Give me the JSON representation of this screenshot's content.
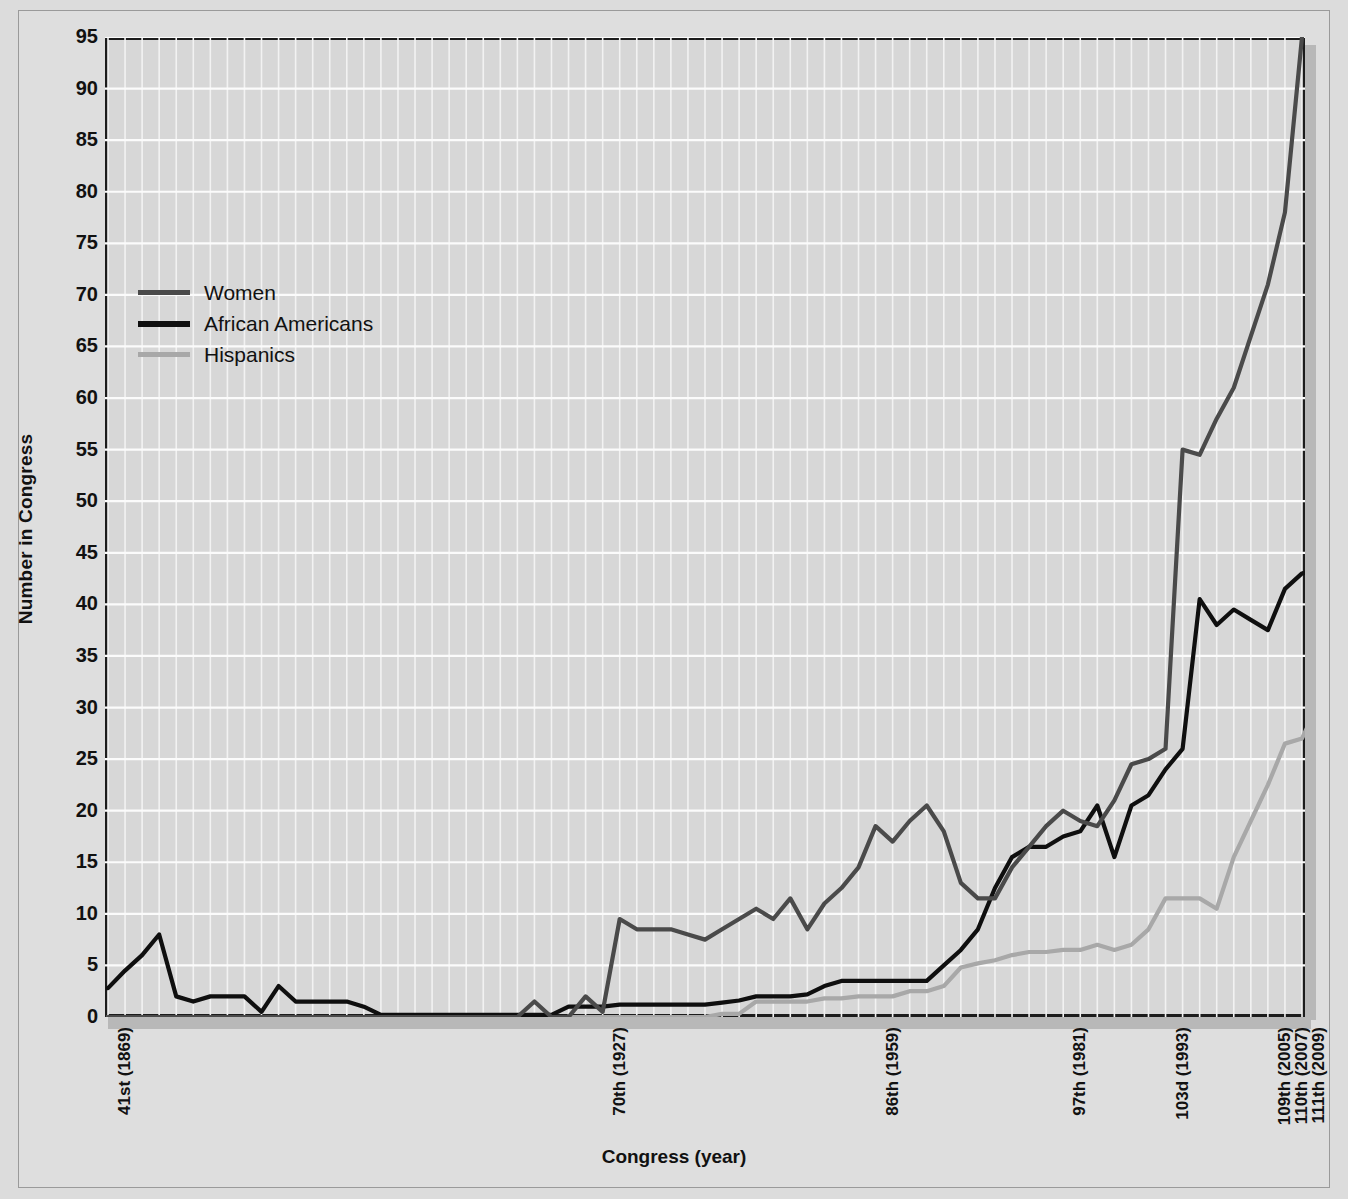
{
  "chart_data": {
    "type": "line",
    "title": "",
    "xlabel": "Congress (year)",
    "ylabel": "Number in Congress",
    "ylim": [
      0,
      95
    ],
    "ytick_step": 5,
    "yticks": [
      95,
      90,
      85,
      80,
      75,
      70,
      65,
      60,
      55,
      50,
      45,
      40,
      35,
      30,
      25,
      20,
      15,
      10,
      5,
      0
    ],
    "grid": true,
    "legend_position": "upper-left",
    "x_tick_labels": [
      {
        "label": "41st (1869)",
        "index": 0
      },
      {
        "label": "70th (1927)",
        "index": 29
      },
      {
        "label": "86th (1959)",
        "index": 45
      },
      {
        "label": "97th (1981)",
        "index": 56
      },
      {
        "label": "103d (1993)",
        "index": 62
      },
      {
        "label": "109th (2005)",
        "index": 68
      },
      {
        "label": "110th (2007)",
        "index": 69
      },
      {
        "label": "111th (2009)",
        "index": 70
      }
    ],
    "x_count": 71,
    "series": [
      {
        "name": "Women",
        "color": "#4a4a4a",
        "values": [
          0,
          0,
          0,
          0,
          0,
          0,
          0,
          0,
          0,
          0,
          0,
          0,
          0,
          0,
          0,
          0,
          0,
          0,
          0,
          0,
          0,
          0,
          0,
          0,
          0,
          1.5,
          0,
          0,
          2,
          0.5,
          9.5,
          8.5,
          8.5,
          8.5,
          8,
          7.5,
          8.5,
          9.5,
          10.5,
          9.5,
          11.5,
          8.5,
          11,
          12.5,
          14.5,
          18.5,
          17,
          19,
          20.5,
          18,
          13,
          11.5,
          11.5,
          14.5,
          16.5,
          18.5,
          20,
          19,
          18.5,
          21,
          24.5,
          25,
          26,
          55,
          54.5,
          58,
          61,
          66,
          71,
          78,
          95
        ]
      },
      {
        "name": "African Americans",
        "color": "#0f0f0f",
        "values": [
          2.8,
          4.5,
          6,
          8,
          2,
          1.5,
          2,
          2,
          2,
          0.5,
          3,
          1.5,
          1.5,
          1.5,
          1.5,
          1,
          0.2,
          0.2,
          0.2,
          0.2,
          0.2,
          0.2,
          0.2,
          0.2,
          0.2,
          0.2,
          0.2,
          1,
          1,
          1,
          1.2,
          1.2,
          1.2,
          1.2,
          1.2,
          1.2,
          1.4,
          1.6,
          2,
          2,
          2,
          2.2,
          3,
          3.5,
          3.5,
          3.5,
          3.5,
          3.5,
          3.5,
          5,
          6.5,
          8.5,
          12.5,
          15.5,
          16.5,
          16.5,
          17.5,
          18,
          20.5,
          15.5,
          20.5,
          21.5,
          24,
          26,
          40.5,
          38,
          39.5,
          38.5,
          37.5,
          41.5,
          43,
          43.5
        ]
      },
      {
        "name": "Hispanics",
        "color": "#a8a8a8",
        "values": [
          0,
          0,
          0,
          0,
          0,
          0,
          0,
          0,
          0,
          0,
          0,
          0,
          0,
          0,
          0,
          0,
          0,
          0,
          0,
          0,
          0,
          0,
          0,
          0,
          0,
          0,
          0,
          0,
          0,
          0,
          0,
          0,
          0,
          0,
          0,
          0,
          0.3,
          0.3,
          1.5,
          1.5,
          1.5,
          1.5,
          1.8,
          1.8,
          2,
          2,
          2,
          2.5,
          2.5,
          3,
          4.8,
          5.2,
          5.5,
          6,
          6.3,
          6.3,
          6.5,
          6.5,
          7,
          6.5,
          7,
          8.5,
          11.5,
          11.5,
          11.5,
          10.5,
          15.5,
          19,
          22.5,
          26.5,
          27,
          30.5
        ]
      }
    ]
  },
  "legend": {
    "items": [
      {
        "label": "Women",
        "color": "#4a4a4a"
      },
      {
        "label": "African Americans",
        "color": "#0f0f0f"
      },
      {
        "label": "Hispanics",
        "color": "#a8a8a8"
      }
    ]
  },
  "axes": {
    "x_title": "Congress (year)",
    "y_title": "Number in Congress"
  }
}
